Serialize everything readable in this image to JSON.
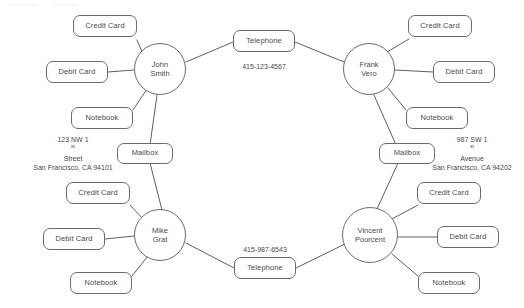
{
  "diagram": {
    "canvas": {
      "width": 524,
      "height": 308
    },
    "colors": {
      "background": "#ffffff",
      "stroke": "#6b6b6b",
      "edge": "#5f5f5f",
      "text": "#4a4a4a"
    },
    "persons": [
      {
        "id": "john-smith",
        "line1": "John",
        "line2": "Smith",
        "x": 160,
        "y": 69,
        "r": 26
      },
      {
        "id": "frank-vero",
        "line1": "Frank",
        "line2": "Vero",
        "x": 369,
        "y": 69,
        "r": 26
      },
      {
        "id": "mike-grat",
        "line1": "Mike",
        "line2": "Grat",
        "x": 160,
        "y": 235,
        "r": 26
      },
      {
        "id": "vincent-pourcent",
        "line1": "Vincent",
        "line2": "Pourcent",
        "x": 370,
        "y": 235,
        "r": 28
      }
    ],
    "items": [
      {
        "id": "credit-card-tl",
        "label": "Credit Card",
        "x": 105,
        "y": 26,
        "w": 64,
        "h": 22
      },
      {
        "id": "debit-card-tl",
        "label": "Debit Card",
        "x": 77,
        "y": 72,
        "w": 62,
        "h": 22
      },
      {
        "id": "notebook-tl",
        "label": "Notebook",
        "x": 102,
        "y": 118,
        "w": 62,
        "h": 22
      },
      {
        "id": "credit-card-tr",
        "label": "Credit Card",
        "x": 440,
        "y": 26,
        "w": 64,
        "h": 22
      },
      {
        "id": "debit-card-tr",
        "label": "Debit Card",
        "x": 464,
        "y": 72,
        "w": 62,
        "h": 22
      },
      {
        "id": "notebook-tr",
        "label": "Notebook",
        "x": 437,
        "y": 118,
        "w": 62,
        "h": 22
      },
      {
        "id": "credit-card-bl",
        "label": "Credit Card",
        "x": 98,
        "y": 193,
        "w": 64,
        "h": 22
      },
      {
        "id": "debit-card-bl",
        "label": "Debit Card",
        "x": 74,
        "y": 239,
        "w": 62,
        "h": 22
      },
      {
        "id": "notebook-bl",
        "label": "Notebook",
        "x": 101,
        "y": 283,
        "w": 62,
        "h": 22
      },
      {
        "id": "credit-card-br",
        "label": "Credit Card",
        "x": 449,
        "y": 193,
        "w": 64,
        "h": 22
      },
      {
        "id": "debit-card-br",
        "label": "Debit Card",
        "x": 468,
        "y": 237,
        "w": 62,
        "h": 22
      },
      {
        "id": "notebook-br",
        "label": "Notebook",
        "x": 449,
        "y": 283,
        "w": 62,
        "h": 22
      }
    ],
    "shared": [
      {
        "id": "telephone-top",
        "label": "Telephone",
        "x": 264,
        "y": 41,
        "w": 62,
        "h": 22
      },
      {
        "id": "telephone-bottom",
        "label": "Telephone",
        "x": 265,
        "y": 268,
        "w": 62,
        "h": 22
      },
      {
        "id": "mailbox-left",
        "label": "Mailbox",
        "x": 145,
        "y": 153,
        "w": 56,
        "h": 21
      },
      {
        "id": "mailbox-right",
        "label": "Mailbox",
        "x": 407,
        "y": 153,
        "w": 56,
        "h": 21
      }
    ],
    "edge_labels": [
      {
        "id": "phone-number-top",
        "text": "415-123-4567",
        "x": 264,
        "y": 66
      },
      {
        "id": "phone-number-bottom",
        "text": "415-987-6543",
        "x": 265,
        "y": 249
      }
    ],
    "addresses": [
      {
        "id": "address-left",
        "street_prefix": "123 NW 1",
        "street_ordinal": "st",
        "street_suffix": " Street",
        "city_line": "San Francisco, CA 94101",
        "x": 73,
        "y": 154
      },
      {
        "id": "address-right",
        "street_prefix": "987 SW 1",
        "street_ordinal": "st",
        "street_suffix": " Avenue",
        "city_line": "San Francisco, CA 94202",
        "x": 472,
        "y": 154
      }
    ],
    "edges": [
      {
        "from": "credit-card-tl",
        "to": "john-smith",
        "x1": 137,
        "y1": 40,
        "x2": 143,
        "y2": 54
      },
      {
        "from": "debit-card-tl",
        "to": "john-smith",
        "x1": 108,
        "y1": 72,
        "x2": 134,
        "y2": 70
      },
      {
        "from": "notebook-tl",
        "to": "john-smith",
        "x1": 133,
        "y1": 110,
        "x2": 147,
        "y2": 89
      },
      {
        "from": "john-smith",
        "to": "mailbox-left",
        "x1": 157,
        "y1": 95,
        "x2": 150,
        "y2": 145
      },
      {
        "from": "john-smith",
        "to": "telephone-top",
        "x1": 186,
        "y1": 62,
        "x2": 233,
        "y2": 42
      },
      {
        "from": "telephone-top",
        "to": "frank-vero",
        "x1": 295,
        "y1": 42,
        "x2": 344,
        "y2": 62
      },
      {
        "from": "frank-vero",
        "to": "credit-card-tr",
        "x1": 387,
        "y1": 52,
        "x2": 409,
        "y2": 39
      },
      {
        "from": "frank-vero",
        "to": "debit-card-tr",
        "x1": 395,
        "y1": 70,
        "x2": 433,
        "y2": 72
      },
      {
        "from": "frank-vero",
        "to": "notebook-tr",
        "x1": 388,
        "y1": 88,
        "x2": 406,
        "y2": 110
      },
      {
        "from": "frank-vero",
        "to": "mailbox-right",
        "x1": 374,
        "y1": 95,
        "x2": 396,
        "y2": 145
      },
      {
        "from": "mailbox-left",
        "to": "mike-grat",
        "x1": 150,
        "y1": 163,
        "x2": 162,
        "y2": 210
      },
      {
        "from": "credit-card-bl",
        "to": "mike-grat",
        "x1": 130,
        "y1": 205,
        "x2": 143,
        "y2": 219
      },
      {
        "from": "debit-card-bl",
        "to": "mike-grat",
        "x1": 105,
        "y1": 239,
        "x2": 134,
        "y2": 236
      },
      {
        "from": "notebook-bl",
        "to": "mike-grat",
        "x1": 132,
        "y1": 276,
        "x2": 148,
        "y2": 256
      },
      {
        "from": "mike-grat",
        "to": "telephone-bottom",
        "x1": 186,
        "y1": 243,
        "x2": 234,
        "y2": 268
      },
      {
        "from": "telephone-bottom",
        "to": "vincent-pourcent",
        "x1": 296,
        "y1": 268,
        "x2": 345,
        "y2": 244
      },
      {
        "from": "mailbox-right",
        "to": "vincent-pourcent",
        "x1": 398,
        "y1": 163,
        "x2": 377,
        "y2": 209
      },
      {
        "from": "vincent-pourcent",
        "to": "credit-card-br",
        "x1": 392,
        "y1": 219,
        "x2": 418,
        "y2": 205
      },
      {
        "from": "vincent-pourcent",
        "to": "debit-card-br",
        "x1": 398,
        "y1": 237,
        "x2": 437,
        "y2": 237
      },
      {
        "from": "vincent-pourcent",
        "to": "notebook-br",
        "x1": 392,
        "y1": 254,
        "x2": 418,
        "y2": 276
      }
    ]
  }
}
